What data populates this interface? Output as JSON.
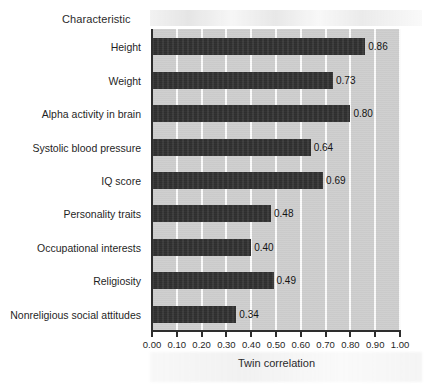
{
  "chart_data": {
    "type": "bar",
    "orientation": "horizontal",
    "title": "",
    "xlabel": "Twin correlation",
    "ylabel": "Characteristic",
    "xlim": [
      0.0,
      1.0
    ],
    "grid": "vertical-white-gridlines",
    "legend": "none",
    "categories": [
      "Height",
      "Weight",
      "Alpha activity in brain",
      "Systolic blood pressure",
      "IQ score",
      "Personality traits",
      "Occupational interests",
      "Religiosity",
      "Nonreligious social attitudes"
    ],
    "values": [
      0.86,
      0.73,
      0.8,
      0.64,
      0.69,
      0.48,
      0.4,
      0.49,
      0.34
    ],
    "value_labels": [
      "0.86",
      "0.73",
      "0.80",
      "0.64",
      "0.69",
      "0.48",
      "0.40",
      "0.49",
      "0.34"
    ],
    "xticks": [
      0.0,
      0.1,
      0.2,
      0.3,
      0.4,
      0.5,
      0.6,
      0.7,
      0.8,
      0.9,
      1.0
    ],
    "xtick_labels": [
      "0.00",
      "0.10",
      "0.20",
      "0.30",
      "0.40",
      "0.50",
      "0.60",
      "0.70",
      "0.80",
      "0.90",
      "1.00"
    ],
    "colors": {
      "bar": "#2b2b2b",
      "plot_background": "#cdcdcd",
      "gridline": "#fbfbfb",
      "axis": "#2e2e2e",
      "page_background": "#ffffff",
      "text": "#1f1f1f"
    }
  }
}
